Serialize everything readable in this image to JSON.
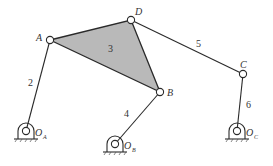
{
  "diagram": {
    "joints": {
      "A": {
        "label": "A",
        "x": 50,
        "y": 40
      },
      "D": {
        "label": "D",
        "x": 131,
        "y": 20
      },
      "B": {
        "label": "B",
        "x": 160,
        "y": 92
      },
      "C": {
        "label": "C",
        "x": 243,
        "y": 74
      }
    },
    "ground_pivots": {
      "OA": {
        "label": "O",
        "sub": "A",
        "x": 26,
        "y": 131
      },
      "OB": {
        "label": "O",
        "sub": "B",
        "x": 115,
        "y": 144
      },
      "OC": {
        "label": "O",
        "sub": "C",
        "x": 237,
        "y": 131
      }
    },
    "links": {
      "l2": "2",
      "l3": "3",
      "l4": "4",
      "l5": "5",
      "l6": "6"
    },
    "colors": {
      "ternary_fill": "#b9b9b9",
      "line": "#2a2a2a"
    }
  }
}
